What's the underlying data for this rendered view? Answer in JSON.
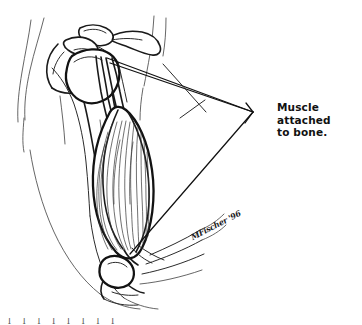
{
  "figure": {
    "kind": "anatomical-line-drawing",
    "background_color": "#ffffff",
    "ink_color": "#1a1a1a",
    "width": 362,
    "height": 325
  },
  "callout": {
    "label": "Muscle attached\nto bone.",
    "line_1": "Muscle attached",
    "line_2": "to bone.",
    "vertex_x": 253,
    "vertex_y": 112,
    "leader_count": 3
  },
  "signature": {
    "text": "MFischer '96"
  },
  "caption": {
    "clipped_text": "l  l   l    l     l    l   l    l"
  },
  "anatomy": {
    "parts": [
      {
        "name": "clavicle",
        "kind": "bone"
      },
      {
        "name": "acromion",
        "kind": "bone"
      },
      {
        "name": "coracoid-process",
        "kind": "bone"
      },
      {
        "name": "scapula",
        "kind": "bone"
      },
      {
        "name": "humeral-head",
        "kind": "bone"
      },
      {
        "name": "humerus-shaft",
        "kind": "bone"
      },
      {
        "name": "biceps-muscle-belly",
        "kind": "muscle"
      },
      {
        "name": "proximal-tendon-long-head",
        "kind": "tendon"
      },
      {
        "name": "proximal-tendon-short-head",
        "kind": "tendon"
      },
      {
        "name": "distal-biceps-tendon",
        "kind": "tendon"
      },
      {
        "name": "elbow-joint",
        "kind": "joint"
      },
      {
        "name": "forearm-contour",
        "kind": "body-outline"
      },
      {
        "name": "torso-contour",
        "kind": "body-outline"
      },
      {
        "name": "arm-skin-contour",
        "kind": "body-outline"
      }
    ]
  }
}
